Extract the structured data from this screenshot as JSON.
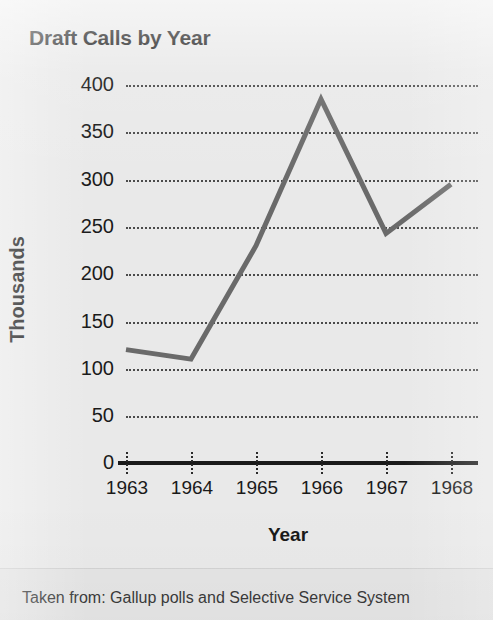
{
  "figure": {
    "title": "Draft Calls by Year",
    "source_note": "Taken from: Gallup polls and Selective Service System",
    "background_color": "#e9e9e9",
    "line_color": "#6a6a6a",
    "text_color": "#1a1a1a",
    "gridline_color": "#4a4a4a",
    "axis_color": "#1a1a1a"
  },
  "chart_data": {
    "type": "line",
    "title": "Draft Calls by Year",
    "xlabel": "Year",
    "ylabel": "Thousands",
    "categories": [
      "1963",
      "1964",
      "1965",
      "1966",
      "1967",
      "1968"
    ],
    "x": [
      1963,
      1964,
      1965,
      1966,
      1967,
      1968
    ],
    "values": [
      120,
      110,
      230,
      385,
      243,
      295
    ],
    "series": [
      {
        "name": "Draft Calls",
        "values": [
          120,
          110,
          230,
          385,
          243,
          295
        ]
      }
    ],
    "xlim": [
      1963,
      1968
    ],
    "ylim": [
      0,
      400
    ],
    "ytick_labels": [
      "0",
      "50",
      "100",
      "150",
      "200",
      "250",
      "300",
      "350",
      "400"
    ],
    "ytick_values": [
      0,
      50,
      100,
      150,
      200,
      250,
      300,
      350,
      400
    ],
    "xtick_labels": [
      "1963",
      "1964",
      "1965",
      "1966",
      "1967",
      "1968"
    ],
    "grid": true,
    "grid_style": "dotted-horizontal",
    "legend": false,
    "legend_position": "none",
    "markers": false,
    "annotations": []
  }
}
